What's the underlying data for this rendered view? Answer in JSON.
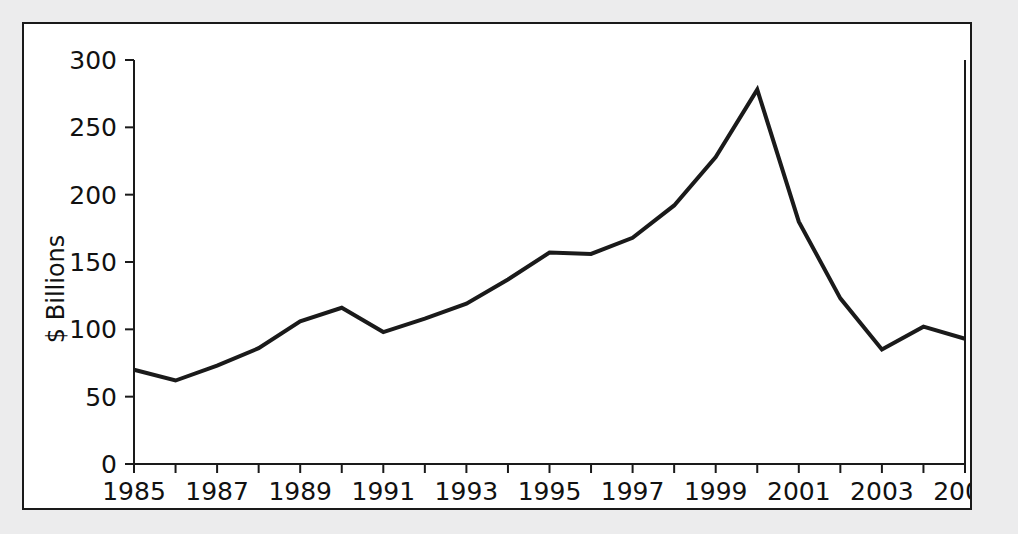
{
  "chart_data": {
    "type": "line",
    "title": "",
    "xlabel": "",
    "ylabel": "$ Billions",
    "xlim": [
      1985,
      2005
    ],
    "ylim": [
      0,
      300
    ],
    "grid": false,
    "legend": null,
    "x": [
      1985,
      1986,
      1987,
      1988,
      1989,
      1990,
      1991,
      1992,
      1993,
      1994,
      1995,
      1996,
      1997,
      1998,
      1999,
      2000,
      2001,
      2002,
      2003,
      2004,
      2005
    ],
    "values": [
      70,
      62,
      73,
      86,
      106,
      116,
      98,
      108,
      119,
      137,
      157,
      156,
      168,
      192,
      228,
      278,
      180,
      123,
      85,
      102,
      93
    ],
    "series": [
      {
        "name": "$ Billions",
        "values": [
          70,
          62,
          73,
          86,
          106,
          116,
          98,
          108,
          119,
          137,
          157,
          156,
          168,
          192,
          228,
          278,
          180,
          123,
          85,
          102,
          93
        ]
      }
    ],
    "y_ticks": [
      0,
      50,
      100,
      150,
      200,
      250,
      300
    ],
    "y_tick_labels": [
      "0",
      "50",
      "100",
      "150",
      "200",
      "250",
      "300"
    ],
    "x_ticks": [
      1985,
      1986,
      1987,
      1988,
      1989,
      1990,
      1991,
      1992,
      1993,
      1994,
      1995,
      1996,
      1997,
      1998,
      1999,
      2000,
      2001,
      2002,
      2003,
      2004,
      2005
    ],
    "x_tick_labels": [
      "1985",
      "",
      "1987",
      "",
      "1989",
      "",
      "1991",
      "",
      "1993",
      "",
      "1995",
      "",
      "1997",
      "",
      "1999",
      "",
      "2001",
      "",
      "2003",
      "",
      "2005"
    ],
    "line_color": "#1a1a1a",
    "background_color": "#ffffff",
    "page_background_color": "#ececed"
  }
}
